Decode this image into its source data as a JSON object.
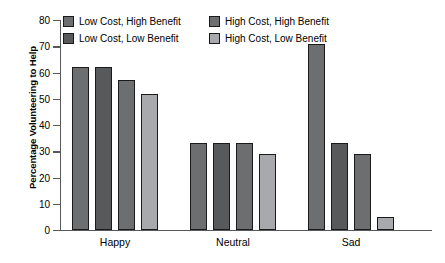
{
  "chart_data": {
    "type": "bar",
    "title": "",
    "xlabel": "",
    "ylabel": "Percentage Volunteering to Help",
    "ylim": [
      0,
      80
    ],
    "yticks": [
      0,
      10,
      20,
      30,
      40,
      50,
      60,
      70,
      80
    ],
    "grid": false,
    "legend_position": "top",
    "categories": [
      "Happy",
      "Neutral",
      "Sad"
    ],
    "series": [
      {
        "name": "Low Cost, High Benefit",
        "color": "#6d6e70",
        "values": [
          62,
          33,
          71
        ]
      },
      {
        "name": "Low Cost, Low Benefit",
        "color": "#58595b",
        "values": [
          62,
          33,
          33
        ]
      },
      {
        "name": "High Cost, High Benefit",
        "color": "#6d6e70",
        "values": [
          57,
          33,
          29
        ]
      },
      {
        "name": "High Cost, Low Benefit",
        "color": "#a7a9ac",
        "values": [
          52,
          29,
          5
        ]
      }
    ]
  },
  "axis": {
    "y_title": "Percentage Volunteering to Help",
    "y_tick_labels": [
      "0",
      "10",
      "20",
      "30",
      "40",
      "50",
      "60",
      "70",
      "80"
    ],
    "x_tick_labels": [
      "Happy",
      "Neutral",
      "Sad"
    ]
  },
  "legend": {
    "entries": [
      {
        "label": "Low Cost, High Benefit",
        "color": "#6d6e70"
      },
      {
        "label": "High Cost, High Benefit",
        "color": "#6d6e70"
      },
      {
        "label": "Low Cost, Low Benefit",
        "color": "#58595b"
      },
      {
        "label": "High Cost, Low Benefit",
        "color": "#a7a9ac"
      }
    ]
  },
  "style": {
    "axis_color": "#58595b",
    "bar_outline": "#1a1a1a",
    "background": "#ffffff"
  }
}
